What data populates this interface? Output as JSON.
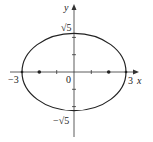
{
  "figure": {
    "type": "ellipse",
    "equation": "x^2/9 + y^2/5 = 1",
    "center": [
      0,
      0
    ],
    "semi_major": 3,
    "semi_minor_label": "√5",
    "foci": [
      [
        -2,
        0
      ],
      [
        2,
        0
      ]
    ]
  },
  "axes": {
    "x_label": "x",
    "y_label": "y",
    "origin_label": "0",
    "x_intercept_left": "−3",
    "x_intercept_right": "3",
    "y_intercept_top": "√5",
    "y_intercept_bottom": "−√5",
    "x_ticks": [
      -2,
      -1,
      1,
      2
    ],
    "y_ticks": [
      -2,
      -1,
      1,
      2
    ]
  },
  "colors": {
    "stroke": "#222222",
    "background": "#ffffff"
  }
}
